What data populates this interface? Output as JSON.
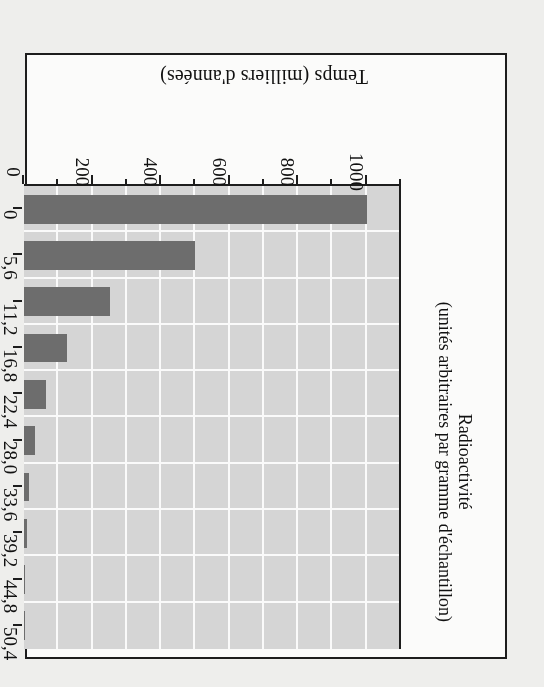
{
  "figure": {
    "rotation_degrees": 180,
    "colors": {
      "plot_background": "#d5d5d5",
      "gridline": "#fafafa",
      "bar": "#6d6d6d",
      "axis": "#1d1d1d",
      "page_background": "#eeeeec",
      "figure_background": "#fbfbfa"
    }
  },
  "chart_data": {
    "type": "bar",
    "orientation": "vertical",
    "title": "",
    "xlabel": "Temps (milliers d'années)",
    "ylabel": "Radioactivité\n(unités arbitraires par gramme d'échantillon)",
    "ylabel_line1": "Radioactivité",
    "ylabel_line2": "(unités arbitraires par gramme d'échantillon)",
    "categories": [
      "0",
      "5,6",
      "11,2",
      "16,8",
      "22,4",
      "28,0",
      "33,6",
      "39,2",
      "44,8",
      "50,4"
    ],
    "values": [
      1000,
      500,
      250,
      125,
      63,
      31,
      16,
      8,
      4,
      2
    ],
    "ylim": [
      0,
      1100
    ],
    "ytick_values": [
      0,
      200,
      400,
      600,
      800,
      1000
    ],
    "ytick_labels": [
      "0",
      "200",
      "400",
      "600",
      "800",
      "1000"
    ],
    "yminor_tick_values": [
      100,
      300,
      500,
      700,
      900,
      1100
    ],
    "grid": true,
    "grid_axis": "both",
    "legend": "none",
    "series": [
      {
        "name": "Radioactivité",
        "values": [
          1000,
          500,
          250,
          125,
          63,
          31,
          16,
          8,
          4,
          2
        ]
      }
    ]
  }
}
